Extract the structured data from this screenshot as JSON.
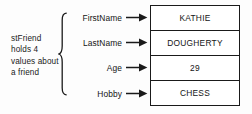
{
  "diagram": {
    "caption": {
      "lines": [
        "stFriend",
        "holds 4",
        "values about",
        "a friend"
      ]
    },
    "brace": {
      "icon": "curly-brace-icon"
    },
    "fields": [
      {
        "label": "FirstName",
        "value": "KATHIE",
        "arrow_icon": "arrow-right-icon"
      },
      {
        "label": "LastName",
        "value": "DOUGHERTY",
        "arrow_icon": "arrow-right-icon"
      },
      {
        "label": "Age",
        "value": "29",
        "arrow_icon": "arrow-right-icon"
      },
      {
        "label": "Hobby",
        "value": "CHESS",
        "arrow_icon": "arrow-right-icon"
      }
    ],
    "colors": {
      "background": "#fdfdfd",
      "stroke": "#1a1a1a",
      "text": "#141414",
      "cell_background": "#ffffff"
    }
  }
}
